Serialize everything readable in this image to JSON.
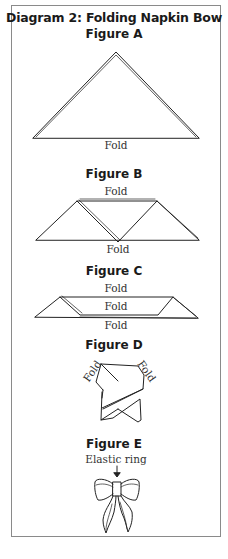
{
  "diagram": {
    "title": "Diagram 2: Folding Napkin Bow",
    "figures": [
      {
        "id": "A",
        "title": "Figure A",
        "labels": [
          "Fold"
        ]
      },
      {
        "id": "B",
        "title": "Figure B",
        "labels": [
          "Fold",
          "Fold"
        ]
      },
      {
        "id": "C",
        "title": "Figure C",
        "labels": [
          "Fold",
          "Fold",
          "Fold"
        ]
      },
      {
        "id": "D",
        "title": "Figure D",
        "labels": [
          "Fold",
          "Fold"
        ]
      },
      {
        "id": "E",
        "title": "Figure E",
        "labels": [
          "Elastic ring"
        ]
      }
    ]
  }
}
